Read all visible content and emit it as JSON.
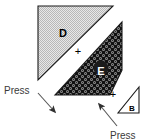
{
  "figure": {
    "background_color": "#ffffff",
    "shapes": [
      {
        "id": "shape-d",
        "label": "D",
        "kind": "right-triangle",
        "fill_style": "light-stipple",
        "fill_color": "#d9d9d9",
        "outline_color": "#1a1a1a",
        "label_color": "#000000",
        "points": "38,6 113,6 38,80",
        "label_x": 63,
        "label_y": 34
      },
      {
        "id": "shape-e",
        "label": "E",
        "kind": "quadrilateral",
        "fill_style": "dark-texture",
        "fill_color": "#2b2b2b",
        "outline_color": "#1a1a1a",
        "label_color": "#ffffff",
        "points": "122,22 122,70 110,95 55,95",
        "label_x": 101,
        "label_y": 72
      },
      {
        "id": "shape-b",
        "label": "B",
        "kind": "right-triangle",
        "fill_style": "white",
        "fill_color": "#ffffff",
        "outline_color": "#1a1a1a",
        "label_color": "#000000",
        "points": "139,87 139,113 118,113",
        "label_x": 132,
        "label_y": 109
      }
    ],
    "plus_signs": [
      {
        "id": "plus-d-e",
        "text": "+",
        "x": 78,
        "y": 52
      },
      {
        "id": "plus-e-b",
        "text": "+",
        "x": 113,
        "y": 95
      }
    ],
    "annotations": [
      {
        "id": "press-left",
        "text": "Press",
        "text_x": 4,
        "text_y": 91,
        "text_color": "#3a3a3a",
        "arrow_from_x": 38,
        "arrow_from_y": 93,
        "arrow_to_x": 55,
        "arrow_to_y": 112,
        "arrow_color": "#555555",
        "direction": "down-right"
      },
      {
        "id": "press-right",
        "text": "Press",
        "text_x": 110,
        "text_y": 136,
        "text_color": "#3a3a3a",
        "arrow_from_x": 117,
        "arrow_from_y": 126,
        "arrow_to_x": 99,
        "arrow_to_y": 104,
        "arrow_color": "#555555",
        "direction": "up-left"
      }
    ]
  }
}
